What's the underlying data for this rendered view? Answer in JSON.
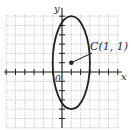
{
  "figure": {
    "type": "ellipse-on-grid",
    "axes": {
      "x_label": "x",
      "y_label": "y",
      "origin_label": "0",
      "x_range": [
        -6,
        6
      ],
      "y_range": [
        -6,
        6
      ],
      "grid": true,
      "grid_style": "dotted"
    },
    "ellipse": {
      "center": [
        1,
        1
      ],
      "semi_axis_x": 2,
      "semi_axis_y": 5
    },
    "center_point": {
      "label": "C(1, 1)",
      "x": 1,
      "y": 1
    },
    "colors": {
      "ink": "#222222",
      "grid": "#9a9a9a",
      "background": "#ffffff"
    }
  }
}
